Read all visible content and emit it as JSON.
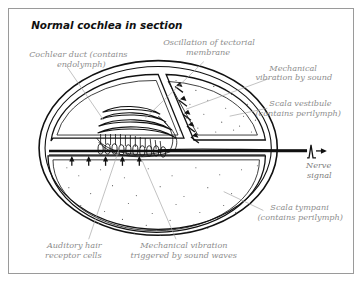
{
  "figure": {
    "title": "Normal cochlea in section",
    "border_color": "#9a9a9a",
    "background_color": "#ffffff",
    "ink_color": "#111111",
    "label_color": "#8d8d8d"
  },
  "labels": {
    "cochlear_duct": {
      "line1": "Cochlear duct (contains",
      "line2": "endolymph)"
    },
    "tectorial": {
      "line1": "Oscillation of tectorial",
      "line2": "membrane"
    },
    "mechanical_vibration_sound": {
      "line1": "Mechanical",
      "line2": "vibration by sound"
    },
    "scala_vestibule": {
      "line1": "Scala vestibule",
      "line2": "(contains perilymph)"
    },
    "nerve_signal": {
      "line1": "Nerve",
      "line2": "signal"
    },
    "scala_tympani": {
      "line1": "Scala tympani",
      "line2": "(contains perilymph)"
    },
    "auditory_hair_cells": {
      "line1": "Auditory hair",
      "line2": "receptor cells"
    },
    "mechanical_vibration_waves": {
      "line1": "Mechanical vibration",
      "line2": "triggered by sound waves"
    }
  },
  "icons": {
    "nerve_spike": "action-potential-spike-icon",
    "vestibuli_arrows": "down-left-arrow-icon",
    "tympani_arrows": "up-arrow-icon"
  },
  "counts": {
    "vestibuli_arrows": 5,
    "tympani_arrows": 5,
    "hair_cells": 13
  }
}
